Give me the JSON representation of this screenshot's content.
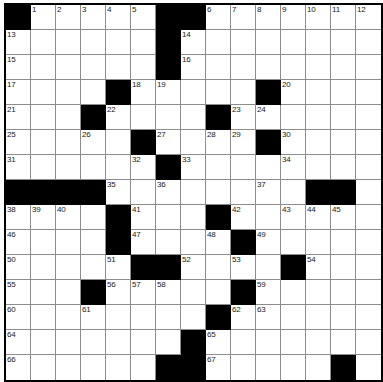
{
  "puzzle": {
    "title": "Crossword Grid",
    "rows": 14,
    "cols": 14,
    "cell_size": 25,
    "colors": {
      "block": "#000000",
      "cell": "#ffffff",
      "gridline": "#8d8d8d",
      "border": "#000000",
      "number_text": "#1a1a1a"
    },
    "grid": [
      [
        "#",
        "1",
        "2",
        "3",
        "4",
        "5",
        "#",
        "#",
        "6",
        "7",
        "8",
        "9",
        "10",
        "11"
      ],
      [
        "13",
        "",
        "",
        "",
        "",
        "",
        "#",
        "14",
        "",
        "",
        "",
        "",
        "",
        ""
      ],
      [
        "15",
        "",
        "",
        "",
        "",
        "",
        "#",
        "16",
        "",
        "",
        "",
        "",
        "",
        ""
      ],
      [
        "17",
        "",
        "",
        "",
        "#",
        "18",
        "19",
        "",
        "",
        "",
        "#",
        "20",
        "",
        ""
      ],
      [
        "21",
        "",
        "",
        "#",
        "22",
        "",
        "",
        "",
        "#",
        "23",
        "24",
        "",
        "",
        ""
      ],
      [
        "25",
        "",
        "",
        "26",
        "",
        "#",
        "27",
        "",
        "28",
        "29",
        "#",
        "30",
        "",
        ""
      ],
      [
        "31",
        "",
        "",
        "",
        "",
        "32",
        "#",
        "33",
        "",
        "",
        "",
        "34",
        "",
        ""
      ],
      [
        "#",
        "",
        "",
        "",
        "35",
        "",
        "36",
        "",
        "",
        "",
        "37",
        "",
        "#",
        "#"
      ],
      [
        "38",
        "39",
        "40",
        "",
        "#",
        "41",
        "",
        "",
        "#",
        "42",
        "",
        "43",
        "44",
        "45"
      ],
      [
        "46",
        "",
        "",
        "",
        "#",
        "47",
        "",
        "",
        "48",
        "#",
        "49",
        "",
        "",
        ""
      ],
      [
        "50",
        "",
        "",
        "",
        "51",
        "#",
        "#",
        "52",
        "",
        "53",
        "",
        "#",
        "54",
        ""
      ],
      [
        "55",
        "",
        "",
        "#",
        "56",
        "57",
        "58",
        "",
        "",
        "#",
        "59",
        "",
        "",
        ""
      ],
      [
        "60",
        "",
        "",
        "61",
        "",
        "",
        "",
        "",
        "#",
        "62",
        "63",
        "",
        "",
        ""
      ],
      [
        "64",
        "",
        "",
        "",
        "",
        "",
        "",
        "#",
        "65",
        "",
        "",
        "",
        "",
        ""
      ],
      [
        "66",
        "",
        "",
        "",
        "",
        "",
        "#",
        "#",
        "67",
        "",
        "",
        "",
        "",
        "#"
      ]
    ],
    "blocks": [
      [
        0,
        0
      ],
      [
        0,
        6
      ],
      [
        0,
        7
      ],
      [
        1,
        6
      ],
      [
        2,
        6
      ],
      [
        3,
        4
      ],
      [
        3,
        10
      ],
      [
        4,
        3
      ],
      [
        4,
        8
      ],
      [
        5,
        5
      ],
      [
        5,
        10
      ],
      [
        6,
        6
      ],
      [
        6,
        12
      ],
      [
        6,
        13
      ],
      [
        7,
        0
      ],
      [
        7,
        1
      ],
      [
        7,
        2
      ],
      [
        7,
        3
      ],
      [
        7,
        11
      ],
      [
        7,
        12
      ],
      [
        7,
        13
      ],
      [
        8,
        4
      ],
      [
        8,
        8
      ],
      [
        9,
        4
      ],
      [
        9,
        9
      ],
      [
        10,
        5
      ],
      [
        10,
        6
      ],
      [
        10,
        11
      ],
      [
        11,
        3
      ],
      [
        11,
        9
      ],
      [
        12,
        8
      ],
      [
        13,
        7
      ],
      [
        14,
        6
      ],
      [
        14,
        7
      ],
      [
        14,
        13
      ]
    ],
    "numbers": {
      "1": [
        0,
        1
      ],
      "2": [
        0,
        2
      ],
      "3": [
        0,
        3
      ],
      "4": [
        0,
        4
      ],
      "5": [
        0,
        5
      ],
      "6": [
        0,
        8
      ],
      "7": [
        0,
        9
      ],
      "8": [
        0,
        10
      ],
      "9": [
        0,
        11
      ],
      "10": [
        0,
        12
      ],
      "11": [
        0,
        13
      ],
      "12": [
        0,
        13
      ],
      "13": [
        1,
        0
      ],
      "14": [
        1,
        7
      ],
      "15": [
        2,
        0
      ],
      "16": [
        2,
        7
      ],
      "17": [
        3,
        0
      ],
      "18": [
        3,
        5
      ],
      "19": [
        3,
        6
      ],
      "20": [
        3,
        11
      ],
      "21": [
        4,
        0
      ],
      "22": [
        4,
        4
      ],
      "23": [
        4,
        9
      ],
      "24": [
        4,
        10
      ],
      "25": [
        5,
        0
      ],
      "26": [
        5,
        3
      ],
      "27": [
        5,
        6
      ],
      "28": [
        5,
        8
      ],
      "29": [
        5,
        9
      ],
      "30": [
        5,
        11
      ],
      "31": [
        6,
        0
      ],
      "32": [
        6,
        5
      ],
      "33": [
        6,
        7
      ],
      "34": [
        6,
        11
      ],
      "35": [
        7,
        4
      ],
      "36": [
        7,
        6
      ],
      "37": [
        7,
        10
      ],
      "38": [
        8,
        0
      ],
      "39": [
        8,
        1
      ],
      "40": [
        8,
        2
      ],
      "41": [
        8,
        5
      ],
      "42": [
        8,
        9
      ],
      "43": [
        8,
        11
      ],
      "44": [
        8,
        12
      ],
      "45": [
        8,
        13
      ],
      "46": [
        9,
        0
      ],
      "47": [
        9,
        5
      ],
      "48": [
        9,
        8
      ],
      "49": [
        9,
        10
      ],
      "50": [
        10,
        0
      ],
      "51": [
        10,
        4
      ],
      "52": [
        10,
        7
      ],
      "53": [
        10,
        9
      ],
      "54": [
        10,
        12
      ],
      "55": [
        11,
        0
      ],
      "56": [
        11,
        4
      ],
      "57": [
        11,
        5
      ],
      "58": [
        11,
        6
      ],
      "59": [
        11,
        10
      ],
      "60": [
        12,
        0
      ],
      "61": [
        12,
        3
      ],
      "62": [
        12,
        9
      ],
      "63": [
        12,
        10
      ],
      "64": [
        13,
        0
      ],
      "65": [
        13,
        8
      ],
      "66": [
        14,
        0
      ],
      "67": [
        14,
        8
      ]
    },
    "cells": [
      [
        {
          "b": true
        },
        {
          "n": "1"
        },
        {
          "n": "2"
        },
        {
          "n": "3"
        },
        {
          "n": "4"
        },
        {
          "n": "5"
        },
        {
          "b": true
        },
        {
          "b": true
        },
        {
          "n": "6"
        },
        {
          "n": "7"
        },
        {
          "n": "8"
        },
        {
          "n": "9"
        },
        {
          "n": "10"
        },
        {
          "n": "11"
        },
        {
          "n": "12"
        }
      ],
      [
        {
          "n": "13"
        },
        {},
        {},
        {},
        {},
        {},
        {
          "b": true
        },
        {
          "n": "14"
        },
        {},
        {},
        {},
        {},
        {},
        {}
      ],
      [
        {
          "n": "15"
        },
        {},
        {},
        {},
        {},
        {},
        {
          "b": true
        },
        {
          "n": "16"
        },
        {},
        {},
        {},
        {},
        {},
        {}
      ],
      [
        {
          "n": "17"
        },
        {},
        {},
        {},
        {
          "b": true
        },
        {
          "n": "18"
        },
        {
          "n": "19"
        },
        {},
        {},
        {},
        {
          "b": true
        },
        {
          "n": "20"
        },
        {},
        {}
      ],
      [
        {
          "n": "21"
        },
        {},
        {},
        {
          "b": true
        },
        {
          "n": "22"
        },
        {},
        {},
        {},
        {
          "b": true
        },
        {
          "n": "23"
        },
        {
          "n": "24"
        },
        {},
        {},
        {}
      ],
      [
        {
          "n": "25"
        },
        {},
        {},
        {
          "n": "26"
        },
        {},
        {
          "b": true
        },
        {
          "n": "27"
        },
        {},
        {
          "n": "28"
        },
        {
          "n": "29"
        },
        {
          "b": true
        },
        {
          "n": "30"
        },
        {},
        {}
      ],
      [
        {
          "n": "31"
        },
        {},
        {},
        {},
        {},
        {
          "n": "32"
        },
        {
          "b": true
        },
        {
          "n": "33"
        },
        {},
        {},
        {},
        {
          "n": "34"
        },
        {},
        {}
      ],
      [
        {
          "b": true
        },
        {
          "b": true
        },
        {
          "b": true
        },
        {
          "b": true
        },
        {
          "n": "35"
        },
        {},
        {
          "n": "36"
        },
        {},
        {},
        {},
        {
          "n": "37"
        },
        {},
        {
          "b": true
        },
        {
          "b": true
        }
      ],
      [
        {
          "n": "38"
        },
        {
          "n": "39"
        },
        {
          "n": "40"
        },
        {},
        {
          "b": true
        },
        {
          "n": "41"
        },
        {},
        {},
        {
          "b": true
        },
        {
          "n": "42"
        },
        {},
        {
          "n": "43"
        },
        {
          "n": "44"
        },
        {
          "n": "45"
        }
      ],
      [
        {
          "n": "46"
        },
        {},
        {},
        {},
        {
          "b": true
        },
        {
          "n": "47"
        },
        {},
        {},
        {
          "n": "48"
        },
        {
          "b": true
        },
        {
          "n": "49"
        },
        {},
        {},
        {}
      ],
      [
        {
          "n": "50"
        },
        {},
        {},
        {},
        {
          "n": "51"
        },
        {
          "b": true
        },
        {
          "b": true
        },
        {
          "n": "52"
        },
        {},
        {
          "n": "53"
        },
        {},
        {
          "b": true
        },
        {
          "n": "54"
        },
        {}
      ],
      [
        {
          "n": "55"
        },
        {},
        {},
        {
          "b": true
        },
        {
          "n": "56"
        },
        {
          "n": "57"
        },
        {
          "n": "58"
        },
        {},
        {},
        {
          "b": true
        },
        {
          "n": "59"
        },
        {},
        {},
        {}
      ],
      [
        {
          "n": "60"
        },
        {},
        {},
        {
          "n": "61"
        },
        {},
        {},
        {},
        {},
        {
          "b": true
        },
        {
          "n": "62"
        },
        {
          "n": "63"
        },
        {},
        {},
        {}
      ],
      [
        {
          "n": "64"
        },
        {},
        {},
        {},
        {},
        {},
        {},
        {
          "b": true
        },
        {
          "n": "65"
        },
        {},
        {},
        {},
        {},
        {}
      ],
      [
        {
          "n": "66"
        },
        {},
        {},
        {},
        {},
        {},
        {
          "b": true
        },
        {
          "b": true
        },
        {
          "n": "67"
        },
        {},
        {},
        {},
        {},
        {
          "b": true
        }
      ]
    ]
  }
}
